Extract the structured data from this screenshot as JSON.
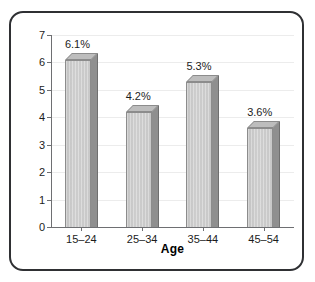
{
  "chart_data": {
    "type": "bar",
    "title": "",
    "subtitle": "",
    "categories": [
      "15–24",
      "25–34",
      "35–44",
      "45–54"
    ],
    "values": [
      6.1,
      4.2,
      5.3,
      3.6
    ],
    "data_labels": [
      "6.1%",
      "4.2%",
      "5.3%",
      "3.6%"
    ],
    "xlabel": "Age",
    "ylabel": "Percent with unipolar depression",
    "ylim": [
      0,
      7
    ],
    "yticks": [
      0,
      1,
      2,
      3,
      4,
      5,
      6,
      7
    ],
    "ytick_labels": [
      "0",
      "1",
      "2",
      "3",
      "4",
      "5",
      "6",
      "7"
    ],
    "grid": true,
    "grid_axis": "y",
    "legend": false,
    "legend_position": "none",
    "style": "3d-shaded-bars",
    "colors": {
      "bar_front": "#d0d0d0",
      "bar_side": "#8f8f8f",
      "bar_top": "#bdbdbd",
      "bar_outline": "#8c8c8c",
      "axis": "#6e6f72",
      "gridline": "#ececec",
      "text": "#1c1c1c",
      "frame_border": "#2f3033",
      "background": "#ffffff"
    }
  }
}
